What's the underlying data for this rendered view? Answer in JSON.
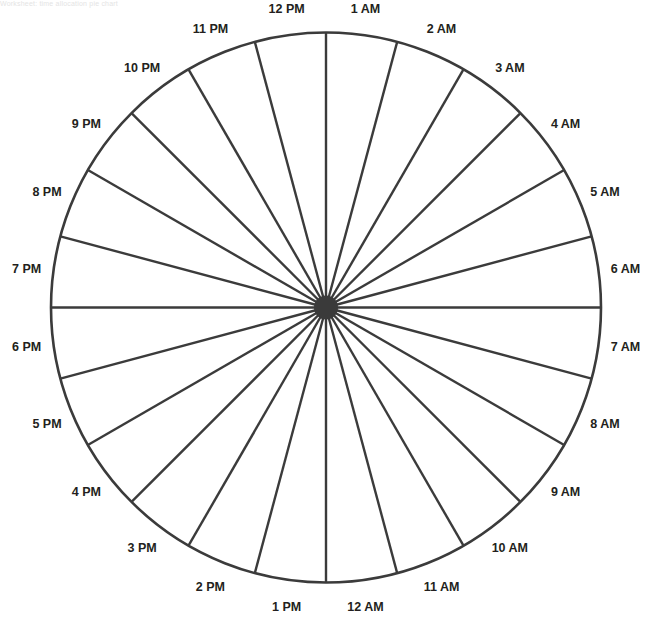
{
  "header": {
    "text": "Worksheet: time allocation pie chart"
  },
  "chart_data": {
    "type": "pie",
    "title": "",
    "segments": 24,
    "segment_angle_deg": 15,
    "center": [
      326,
      307.5
    ],
    "radius": 275,
    "label_radius": 302,
    "center_dot_radius": 12,
    "stroke_color": "#3b3b3b",
    "label_color": "#231f20",
    "categories": [
      "1 AM",
      "2 AM",
      "3 AM",
      "4 AM",
      "5 AM",
      "6 AM",
      "7 AM",
      "8 AM",
      "9 AM",
      "10 AM",
      "11 AM",
      "12 AM",
      "1 PM",
      "2 PM",
      "3 PM",
      "4 PM",
      "5 PM",
      "6 PM",
      "7 PM",
      "8 PM",
      "9 PM",
      "10 PM",
      "11 PM",
      "12 PM"
    ],
    "values": [
      1,
      1,
      1,
      1,
      1,
      1,
      1,
      1,
      1,
      1,
      1,
      1,
      1,
      1,
      1,
      1,
      1,
      1,
      1,
      1,
      1,
      1,
      1,
      1
    ],
    "label_angles_deg_clockwise_from_top": [
      7.5,
      22.5,
      37.5,
      52.5,
      67.5,
      82.5,
      97.5,
      112.5,
      127.5,
      142.5,
      157.5,
      172.5,
      187.5,
      202.5,
      217.5,
      232.5,
      247.5,
      262.5,
      277.5,
      292.5,
      307.5,
      322.5,
      337.5,
      352.5
    ]
  }
}
